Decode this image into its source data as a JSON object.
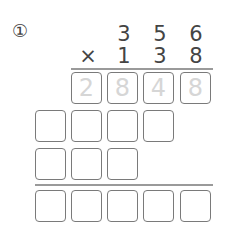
{
  "problem": {
    "label": "①",
    "multiplicand": [
      "3",
      "5",
      "6"
    ],
    "operator": "×",
    "multiplier": [
      "1",
      "3",
      "8"
    ],
    "partial_rows": [
      {
        "cells": [
          "2",
          "8",
          "4",
          "8"
        ],
        "hint": true
      },
      {
        "cells": [
          "",
          "",
          "",
          ""
        ],
        "hint": false
      },
      {
        "cells": [
          "",
          "",
          ""
        ],
        "hint": false
      }
    ],
    "result_row": {
      "cells": [
        "",
        "",
        "",
        "",
        ""
      ]
    }
  }
}
